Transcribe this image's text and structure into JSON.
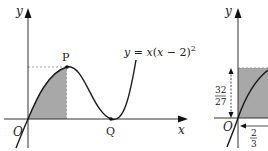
{
  "left_figure": {
    "equation_label": "y = x(x − 2)²",
    "equation_parts": {
      "lhs": "y",
      "eq": " = ",
      "x": "x",
      "open": "(",
      "x2": "x",
      "minus": " − 2)",
      "sup": "2"
    },
    "y_axis_label": "y",
    "x_axis_label": "x",
    "origin_label": "O",
    "point_p_label": "P",
    "point_q_label": "Q"
  },
  "right_figure": {
    "y_axis_label": "y",
    "origin_label": "O",
    "height_label_num": "32",
    "height_label_den": "27",
    "width_label_num": "2",
    "width_label_den": "3"
  },
  "colors": {
    "shade": "#a8a8a8",
    "curve": "#1a1a1a",
    "axis": "#333333",
    "dashed": "#888888"
  }
}
